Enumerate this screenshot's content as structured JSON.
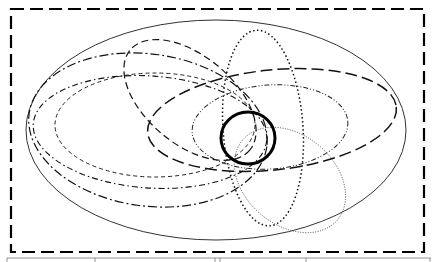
{
  "diagram": {
    "type": "overlapping-ellipses",
    "frame": {
      "x": 11,
      "y": 9,
      "width": 413,
      "height": 243,
      "stroke": "#000000",
      "style": "long-dash"
    },
    "shapes": [
      {
        "id": "outer-solid-ellipse",
        "cx": 216,
        "cy": 130,
        "rx": 190,
        "ry": 110,
        "rotate": 0,
        "stroke_width": 1,
        "dash": "",
        "stroke": "#333333"
      },
      {
        "id": "dashdot-large-ellipse",
        "cx": 148,
        "cy": 130,
        "rx": 120,
        "ry": 76,
        "rotate": 8,
        "stroke_width": 1.2,
        "dash": "9,3,2,3",
        "stroke": "#111111"
      },
      {
        "id": "dashdotdot-left-ellipse",
        "cx": 150,
        "cy": 132,
        "rx": 117,
        "ry": 56,
        "rotate": 4,
        "stroke_width": 1.1,
        "dash": "6,3,1.5,3",
        "stroke": "#111111"
      },
      {
        "id": "shortdash-left-ellipse",
        "cx": 155,
        "cy": 125,
        "rx": 100,
        "ry": 52,
        "rotate": 0,
        "stroke_width": 1,
        "dash": "4,3",
        "stroke": "#222222"
      },
      {
        "id": "dashed-tilted-ellipse",
        "cx": 190,
        "cy": 100,
        "rx": 78,
        "ry": 44,
        "rotate": 40,
        "stroke_width": 1.2,
        "dash": "7,4",
        "stroke": "#111111"
      },
      {
        "id": "dotted-tall-ellipse",
        "cx": 263,
        "cy": 128,
        "rx": 40,
        "ry": 98,
        "rotate": -4,
        "stroke_width": 1.5,
        "dash": "1.5,2.5",
        "stroke": "#111111"
      },
      {
        "id": "longdash-right-ellipse",
        "cx": 272,
        "cy": 120,
        "rx": 125,
        "ry": 50,
        "rotate": -6,
        "stroke_width": 1.5,
        "dash": "12,5",
        "stroke": "#111111"
      },
      {
        "id": "dashdotdot-right-ellipse",
        "cx": 270,
        "cy": 127,
        "rx": 78,
        "ry": 42,
        "rotate": -4,
        "stroke_width": 1,
        "dash": "5,2,1,2,1,2",
        "stroke": "#222222"
      },
      {
        "id": "thin-dotted-lower-ellipse",
        "cx": 290,
        "cy": 180,
        "rx": 62,
        "ry": 45,
        "rotate": 40,
        "stroke_width": 0.8,
        "dash": "1,1.5",
        "stroke": "#333333"
      },
      {
        "id": "thick-solid-circle",
        "cx": 248,
        "cy": 138,
        "rx": 27,
        "ry": 26,
        "rotate": 0,
        "stroke_width": 3,
        "dash": "",
        "stroke": "#000000"
      }
    ],
    "bottom_strip": {
      "dividers_x": [
        95,
        215,
        305
      ],
      "stroke": "#777777"
    }
  }
}
